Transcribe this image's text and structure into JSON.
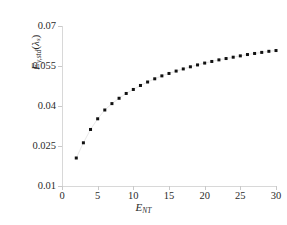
{
  "figure": {
    "background_color": "#ffffff",
    "axis_color": "#d8d8d8",
    "marker_color": "#111111",
    "connector_color": "#e8e8e8",
    "text_color": "#2b2b2b"
  },
  "axes": {
    "x_title_main": "E",
    "x_title_sub": "NT",
    "y_title_main": "E",
    "y_title_sub": "y,std",
    "y_title_arg_open": "(",
    "y_title_lambda": "λ",
    "y_title_lambda_sub": "s",
    "y_title_arg_close": ")",
    "x_ticks": [
      "0",
      "5",
      "10",
      "15",
      "20",
      "25",
      "30"
    ],
    "y_ticks": [
      "0.01",
      "0.025",
      "0.04",
      "0.055",
      "0.07"
    ]
  },
  "chart_data": {
    "type": "scatter",
    "title": "",
    "xlabel": "E_NT",
    "ylabel": "E_y,std(λ_s)",
    "xlim": [
      0,
      30
    ],
    "ylim": [
      0.01,
      0.07
    ],
    "xticks": [
      0,
      5,
      10,
      15,
      20,
      25,
      30
    ],
    "yticks": [
      0.01,
      0.025,
      0.04,
      0.055,
      0.07
    ],
    "grid": false,
    "legend": false,
    "marker": "square",
    "marker_color": "#111111",
    "connector_line": true,
    "connector_color": "#e8e8e8",
    "series": [
      {
        "name": "E_y,std(lambda_s)",
        "x": [
          2,
          3,
          4,
          5,
          6,
          7,
          8,
          9,
          10,
          11,
          12,
          13,
          14,
          15,
          16,
          17,
          18,
          19,
          20,
          21,
          22,
          23,
          24,
          25,
          26,
          27,
          28,
          29,
          30
        ],
        "y": [
          0.0205,
          0.0262,
          0.0312,
          0.0352,
          0.0385,
          0.0409,
          0.0429,
          0.0447,
          0.0462,
          0.0477,
          0.049,
          0.0502,
          0.0513,
          0.0522,
          0.0531,
          0.0539,
          0.0547,
          0.0554,
          0.0561,
          0.0567,
          0.0573,
          0.0578,
          0.0583,
          0.0588,
          0.0593,
          0.0597,
          0.0601,
          0.0605,
          0.0608
        ]
      }
    ]
  }
}
